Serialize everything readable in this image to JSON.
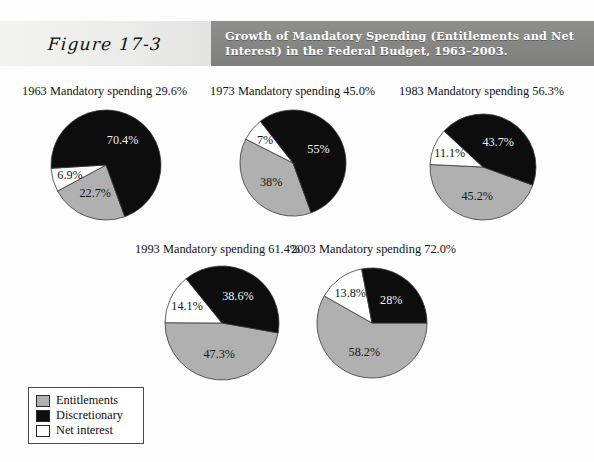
{
  "figure": {
    "label": "Figure 17-3",
    "title": "Growth of Mandatory Spending (Entitlements and Net Interest) in the Federal Budget, 1963–2003."
  },
  "legend": {
    "items": [
      {
        "label": "Entitlements",
        "color": "#b0b0b0"
      },
      {
        "label": "Discretionary",
        "color": "#0d0d0d"
      },
      {
        "label": "Net interest",
        "color": "#ffffff"
      }
    ]
  },
  "charts": [
    {
      "caption": "1963 Mandatory spending 29.6%",
      "labels": {
        "entitlements": "22.7%",
        "discretionary": "70.4%",
        "net_interest": "6.9%"
      }
    },
    {
      "caption": "1973 Mandatory spending 45.0%",
      "labels": {
        "entitlements": "38%",
        "discretionary": "55%",
        "net_interest": "7%"
      }
    },
    {
      "caption": "1983 Mandatory spending 56.3%",
      "labels": {
        "entitlements": "45.2%",
        "discretionary": "43.7%",
        "net_interest": "11.1%"
      }
    },
    {
      "caption": "1993 Mandatory spending 61.4%",
      "labels": {
        "entitlements": "47.3%",
        "discretionary": "38.6%",
        "net_interest": "14.1%"
      }
    },
    {
      "caption": "2003 Mandatory spending 72.0%",
      "labels": {
        "entitlements": "58.2%",
        "discretionary": "28%",
        "net_interest": "13.8%"
      }
    }
  ],
  "chart_data": {
    "type": "pie",
    "title": "Growth of Mandatory Spending (Entitlements and Net Interest) in the Federal Budget, 1963–2003.",
    "categories": [
      "Entitlements",
      "Discretionary",
      "Net interest"
    ],
    "colors": [
      "#b0b0b0",
      "#0d0d0d",
      "#ffffff"
    ],
    "legend_position": "bottom-left",
    "grid": false,
    "charts": [
      {
        "year": 1963,
        "title": "1963 Mandatory spending 29.6%",
        "mandatory_spending_pct": 29.6,
        "values": [
          22.7,
          70.4,
          6.9
        ],
        "value_labels": [
          "22.7%",
          "70.4%",
          "6.9%"
        ],
        "start_angle_deg": 160,
        "slice_order": [
          "Entitlements",
          "Net interest",
          "Discretionary"
        ]
      },
      {
        "year": 1973,
        "title": "1973 Mandatory spending 45.0%",
        "mandatory_spending_pct": 45.0,
        "values": [
          38,
          55,
          7
        ],
        "value_labels": [
          "38%",
          "55%",
          "7%"
        ],
        "start_angle_deg": 160,
        "slice_order": [
          "Entitlements",
          "Net interest",
          "Discretionary"
        ]
      },
      {
        "year": 1983,
        "title": "1983 Mandatory spending 56.3%",
        "mandatory_spending_pct": 56.3,
        "values": [
          45.2,
          43.7,
          11.1
        ],
        "value_labels": [
          "45.2%",
          "43.7%",
          "11.1%"
        ],
        "start_angle_deg": 110,
        "slice_order": [
          "Entitlements",
          "Net interest",
          "Discretionary"
        ]
      },
      {
        "year": 1993,
        "title": "1993 Mandatory spending 61.4%",
        "mandatory_spending_pct": 61.4,
        "values": [
          47.3,
          38.6,
          14.1
        ],
        "value_labels": [
          "47.3%",
          "38.6%",
          "14.1%"
        ],
        "start_angle_deg": 100,
        "slice_order": [
          "Entitlements",
          "Net interest",
          "Discretionary"
        ]
      },
      {
        "year": 2003,
        "title": "2003 Mandatory spending 72.0%",
        "mandatory_spending_pct": 72.0,
        "values": [
          58.2,
          28,
          13.8
        ],
        "value_labels": [
          "58.2%",
          "28%",
          "13.8%"
        ],
        "start_angle_deg": 90,
        "slice_order": [
          "Entitlements",
          "Net interest",
          "Discretionary"
        ]
      }
    ]
  },
  "layout": {
    "pies": [
      {
        "cx": 106,
        "cy": 165,
        "r": 55,
        "caption_x": 22,
        "caption_y": 84
      },
      {
        "cx": 293,
        "cy": 163,
        "r": 53,
        "caption_x": 210,
        "caption_y": 84
      },
      {
        "cx": 483,
        "cy": 167,
        "r": 53,
        "caption_x": 399,
        "caption_y": 84
      },
      {
        "cx": 222,
        "cy": 323,
        "r": 57,
        "caption_x": 135,
        "caption_y": 242
      },
      {
        "cx": 372,
        "cy": 323,
        "r": 55,
        "caption_x": 291,
        "caption_y": 242
      }
    ]
  }
}
